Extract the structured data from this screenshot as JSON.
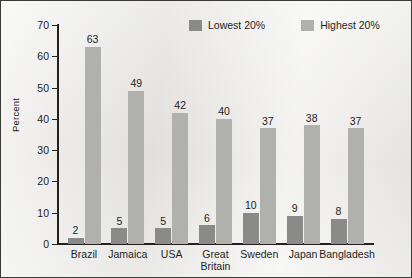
{
  "chart_data": {
    "type": "bar",
    "title": "",
    "xlabel": "",
    "ylabel": "Percent",
    "ylim": [
      0,
      70
    ],
    "yticks": [
      0,
      10,
      20,
      30,
      40,
      50,
      60,
      70
    ],
    "grid": false,
    "legend_position": "top-center",
    "categories": [
      "Brazil",
      "Jamaica",
      "USA",
      "Great\nBritain",
      "Sweden",
      "Japan",
      "Bangladesh"
    ],
    "series": [
      {
        "name": "Lowest 20%",
        "color": "#8a8a88",
        "values": [
          2,
          5,
          5,
          6,
          10,
          9,
          8
        ]
      },
      {
        "name": "Highest 20%",
        "color": "#b0b0ad",
        "values": [
          63,
          49,
          42,
          40,
          37,
          38,
          37
        ]
      }
    ]
  }
}
